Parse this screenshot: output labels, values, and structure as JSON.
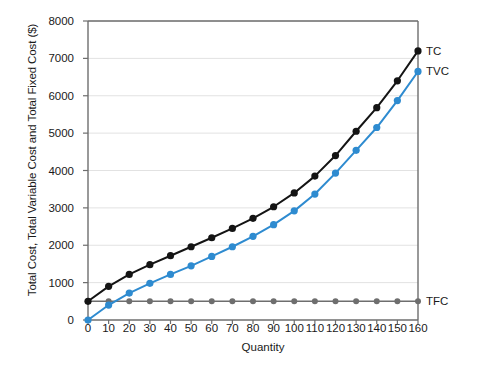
{
  "chart_data": {
    "type": "line",
    "title": "",
    "xlabel": "Quantity",
    "ylabel": "Total Cost, Total Variable Cost and Total Fixed Cost ($)",
    "x": [
      0,
      10,
      20,
      30,
      40,
      50,
      60,
      70,
      80,
      90,
      100,
      110,
      120,
      130,
      140,
      150,
      160
    ],
    "xlim": [
      0,
      160
    ],
    "ylim": [
      0,
      8000
    ],
    "xticks": [
      "0",
      "10",
      "20",
      "30",
      "40",
      "50",
      "60",
      "70",
      "80",
      "90",
      "100",
      "110",
      "120",
      "130",
      "140",
      "150",
      "160"
    ],
    "yticks": [
      "0",
      "1000",
      "2000",
      "3000",
      "4000",
      "5000",
      "6000",
      "7000",
      "8000"
    ],
    "grid": "horizontal",
    "legend_position": "right-inline",
    "series": [
      {
        "name": "TC",
        "label": "TC",
        "color": "#141414",
        "values": [
          500,
          900,
          1220,
          1480,
          1720,
          1960,
          2200,
          2450,
          2720,
          3030,
          3400,
          3850,
          4400,
          5050,
          5680,
          6400,
          7200
        ]
      },
      {
        "name": "TVC",
        "label": "TVC",
        "color": "#2E8BD0",
        "values": [
          0,
          400,
          720,
          980,
          1220,
          1450,
          1700,
          1960,
          2240,
          2550,
          2920,
          3370,
          3930,
          4540,
          5150,
          5870,
          6650
        ]
      },
      {
        "name": "TFC",
        "label": "TFC",
        "color": "#6E6E6E",
        "values": [
          500,
          500,
          500,
          500,
          500,
          500,
          500,
          500,
          500,
          500,
          500,
          500,
          500,
          500,
          500,
          500,
          500
        ]
      }
    ]
  },
  "colors": {
    "axis": "#6E6E6E",
    "grid": "#E2E2E2",
    "background": "#FFFFFF",
    "text": "#1A1A1A"
  }
}
